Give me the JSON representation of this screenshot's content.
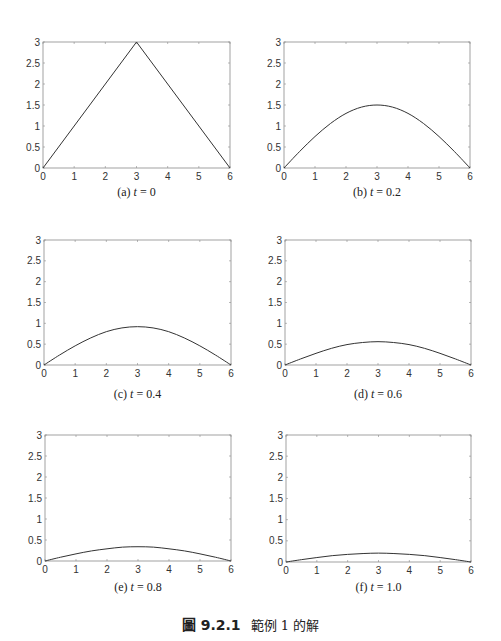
{
  "figure": {
    "caption_number": "圖 9.2.1",
    "caption_text": "範例 1 的解"
  },
  "chart_data": [
    {
      "type": "line",
      "panel": "a",
      "caption_prefix": "(a) ",
      "caption_var": "t",
      "caption_value": " = 0",
      "xlim": [
        0,
        6
      ],
      "ylim": [
        0,
        3
      ],
      "xticks": [
        "0",
        "1",
        "2",
        "3",
        "4",
        "5",
        "6"
      ],
      "yticks": [
        "0",
        "0.5",
        "1",
        "1.5",
        "2",
        "2.5",
        "3"
      ],
      "x": [
        0,
        3,
        6
      ],
      "y": [
        0,
        3,
        0
      ]
    },
    {
      "type": "line",
      "panel": "b",
      "caption_prefix": "(b) ",
      "caption_var": "t",
      "caption_value": " = 0.2",
      "xlim": [
        0,
        6
      ],
      "ylim": [
        0,
        3
      ],
      "xticks": [
        "0",
        "1",
        "2",
        "3",
        "4",
        "5",
        "6"
      ],
      "yticks": [
        "0",
        "0.5",
        "1",
        "1.5",
        "2",
        "2.5",
        "3"
      ],
      "x": [
        0,
        0.5,
        1,
        1.5,
        2,
        2.5,
        3,
        3.5,
        4,
        4.5,
        5,
        5.5,
        6
      ],
      "y": [
        0,
        0.39,
        0.75,
        1.06,
        1.3,
        1.45,
        1.5,
        1.45,
        1.3,
        1.06,
        0.75,
        0.39,
        0
      ]
    },
    {
      "type": "line",
      "panel": "c",
      "caption_prefix": "(c) ",
      "caption_var": "t",
      "caption_value": " = 0.4",
      "xlim": [
        0,
        6
      ],
      "ylim": [
        0,
        3
      ],
      "xticks": [
        "0",
        "1",
        "2",
        "3",
        "4",
        "5",
        "6"
      ],
      "yticks": [
        "0",
        "0.5",
        "1",
        "1.5",
        "2",
        "2.5",
        "3"
      ],
      "x": [
        0,
        0.5,
        1,
        1.5,
        2,
        2.5,
        3,
        3.5,
        4,
        4.5,
        5,
        5.5,
        6
      ],
      "y": [
        0,
        0.24,
        0.46,
        0.65,
        0.8,
        0.89,
        0.92,
        0.89,
        0.8,
        0.65,
        0.46,
        0.24,
        0
      ]
    },
    {
      "type": "line",
      "panel": "d",
      "caption_prefix": "(d) ",
      "caption_var": "t",
      "caption_value": " = 0.6",
      "xlim": [
        0,
        6
      ],
      "ylim": [
        0,
        3
      ],
      "xticks": [
        "0",
        "1",
        "2",
        "3",
        "4",
        "5",
        "6"
      ],
      "yticks": [
        "0",
        "0.5",
        "1",
        "1.5",
        "2",
        "2.5",
        "3"
      ],
      "x": [
        0,
        0.5,
        1,
        1.5,
        2,
        2.5,
        3,
        3.5,
        4,
        4.5,
        5,
        5.5,
        6
      ],
      "y": [
        0,
        0.145,
        0.28,
        0.4,
        0.49,
        0.54,
        0.56,
        0.54,
        0.49,
        0.4,
        0.28,
        0.145,
        0
      ]
    },
    {
      "type": "line",
      "panel": "e",
      "caption_prefix": "(e) ",
      "caption_var": "t",
      "caption_value": " = 0.8",
      "xlim": [
        0,
        6
      ],
      "ylim": [
        0,
        3
      ],
      "xticks": [
        "0",
        "1",
        "2",
        "3",
        "4",
        "5",
        "6"
      ],
      "yticks": [
        "0",
        "0.5",
        "1",
        "1.5",
        "2",
        "2.5",
        "3"
      ],
      "x": [
        0,
        0.5,
        1,
        1.5,
        2,
        2.5,
        3,
        3.5,
        4,
        4.5,
        5,
        5.5,
        6
      ],
      "y": [
        0,
        0.09,
        0.17,
        0.24,
        0.29,
        0.33,
        0.34,
        0.33,
        0.29,
        0.24,
        0.17,
        0.09,
        0
      ]
    },
    {
      "type": "line",
      "panel": "f",
      "caption_prefix": "(f) ",
      "caption_var": "t",
      "caption_value": " = 1.0",
      "xlim": [
        0,
        6
      ],
      "ylim": [
        0,
        3
      ],
      "xticks": [
        "0",
        "1",
        "2",
        "3",
        "4",
        "5",
        "6"
      ],
      "yticks": [
        "0",
        "0.5",
        "1",
        "1.5",
        "2",
        "2.5",
        "3"
      ],
      "x": [
        0,
        0.5,
        1,
        1.5,
        2,
        2.5,
        3,
        3.5,
        4,
        4.5,
        5,
        5.5,
        6
      ],
      "y": [
        0,
        0.055,
        0.105,
        0.15,
        0.18,
        0.2,
        0.21,
        0.2,
        0.18,
        0.15,
        0.105,
        0.055,
        0
      ]
    }
  ]
}
